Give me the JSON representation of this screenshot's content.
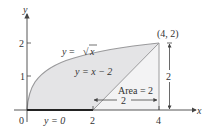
{
  "figure": {
    "type": "area-between-curves diagram",
    "axes": {
      "x_label": "x",
      "y_label": "y",
      "x_ticks": [
        "0",
        "2",
        "4"
      ],
      "y_ticks": [
        "1",
        "2"
      ]
    },
    "curves": [
      {
        "name": "upper",
        "label_prefix": "y = ",
        "label_rad": "x",
        "equation": "y = √x"
      },
      {
        "name": "lower-right",
        "label": "y = x − 2",
        "equation": "y = x - 2"
      },
      {
        "name": "lower-left",
        "label": "y = 0",
        "equation": "y = 0"
      }
    ],
    "point": {
      "label": "(4, 2)",
      "x": 4,
      "y": 2
    },
    "annotations": {
      "area_label": "Area = 2",
      "base_length": "2",
      "height_length": "2"
    },
    "colors": {
      "region_fill": "#e4e4e6",
      "triangle_fill": "#f3f3f4",
      "curve": "#9a9a9c",
      "axis": "#444444",
      "text": "#333333"
    }
  }
}
